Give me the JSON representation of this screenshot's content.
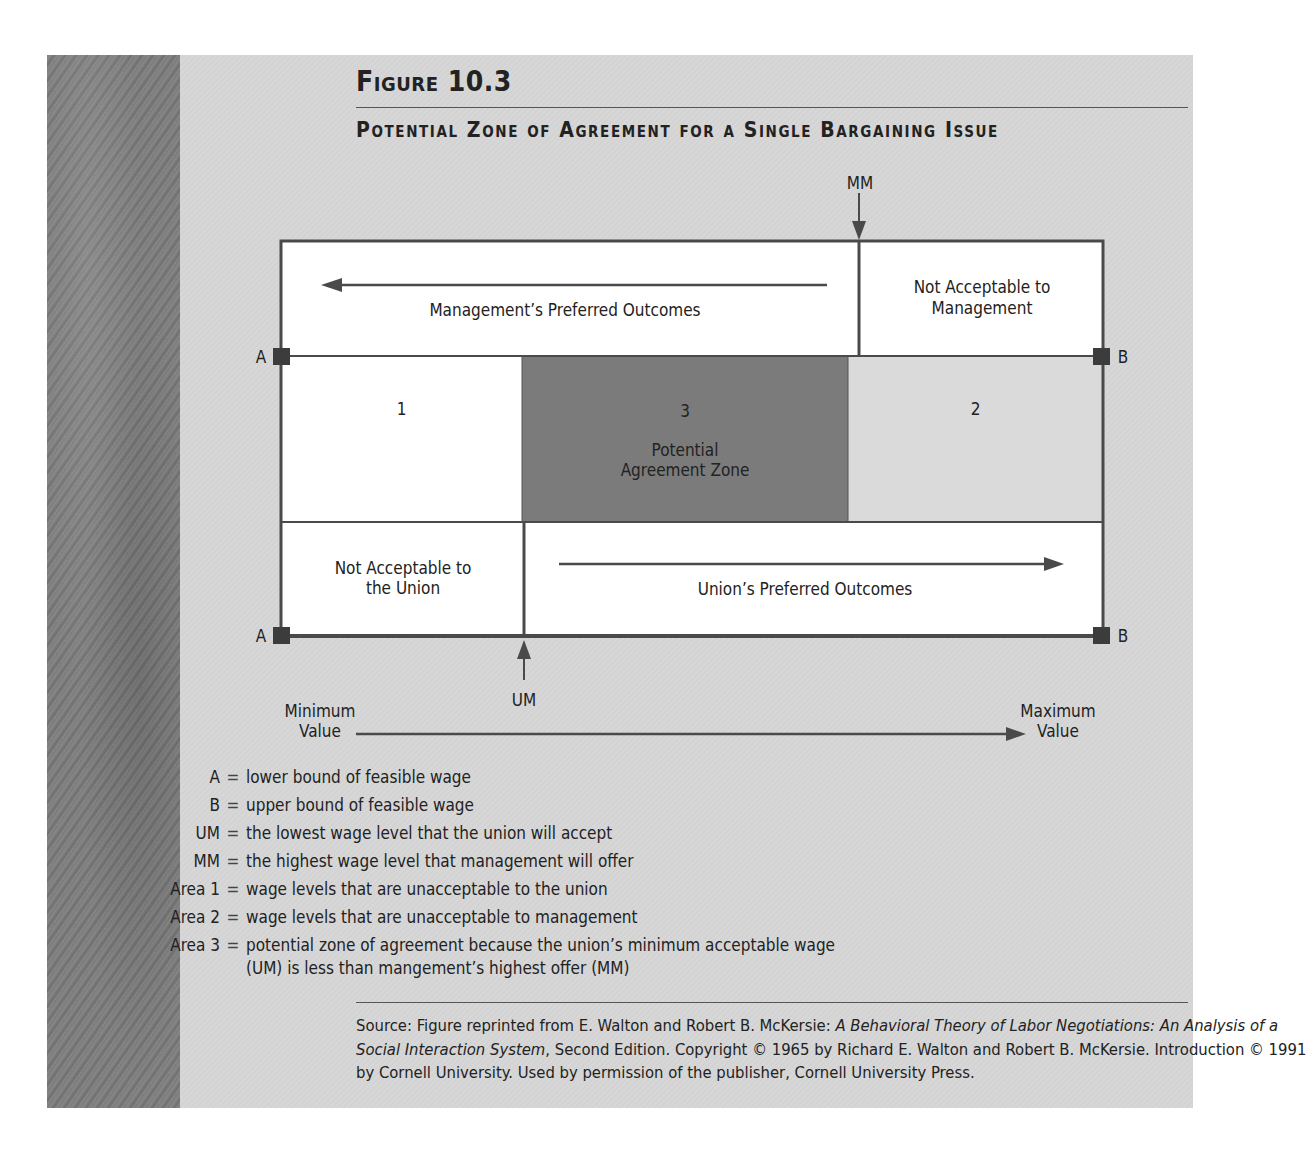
{
  "figure": {
    "label": "Figure 10.3",
    "title": "Potential Zone of Agreement for a Single Bargaining Issue"
  },
  "diagram": {
    "markers": {
      "mm": "MM",
      "um": "UM",
      "a_top": "A",
      "b_top": "B",
      "a_bottom": "A",
      "b_bottom": "B"
    },
    "top_row": {
      "management_preferred": "Management’s Preferred Outcomes",
      "not_acceptable_mgmt_line1": "Not Acceptable to",
      "not_acceptable_mgmt_line2": "Management"
    },
    "middle_row": {
      "area1": "1",
      "area3_number": "3",
      "area3_line1": "Potential",
      "area3_line2": "Agreement Zone",
      "area2": "2"
    },
    "bottom_row": {
      "not_acceptable_union_line1": "Not Acceptable to",
      "not_acceptable_union_line2": "the Union",
      "union_preferred": "Union’s Preferred Outcomes"
    },
    "axis": {
      "min_line1": "Minimum",
      "min_line2": "Value",
      "max_line1": "Maximum",
      "max_line2": "Value"
    },
    "colors": {
      "border": "#4a4a4a",
      "area3_fill": "#7a7a7a",
      "area2_fill": "#d9d9d9",
      "white_fill": "#ffffff"
    }
  },
  "legend": [
    {
      "key": "A",
      "eq": "=",
      "text": "lower bound of feasible wage"
    },
    {
      "key": "B",
      "eq": "=",
      "text": "upper bound of feasible wage"
    },
    {
      "key": "UM",
      "eq": "=",
      "text": "the lowest wage level that the union will accept"
    },
    {
      "key": "MM",
      "eq": "=",
      "text": "the highest wage level that management will offer"
    },
    {
      "key": "Area 1",
      "eq": "=",
      "text": "wage levels that are unacceptable to the union"
    },
    {
      "key": "Area 2",
      "eq": "=",
      "text": "wage levels that are unacceptable to management"
    },
    {
      "key": "Area 3",
      "eq": "=",
      "text": "potential zone of agreement because the union’s minimum acceptable wage",
      "text2": "(UM) is less than mangement’s highest offer (MM)"
    }
  ],
  "source": {
    "prefix": "Source: Figure reprinted from E. Walton and Robert B. McKersie: ",
    "book_title": "A Behavioral Theory of Labor Negotiations: An Analysis of a Social Interaction System",
    "suffix": ", Second Edition. Copyright © 1965 by Richard E. Walton and Robert B. McKersie. Introduction © 1991 by Cornell University. Used by permission of the publisher, Cornell University Press."
  }
}
